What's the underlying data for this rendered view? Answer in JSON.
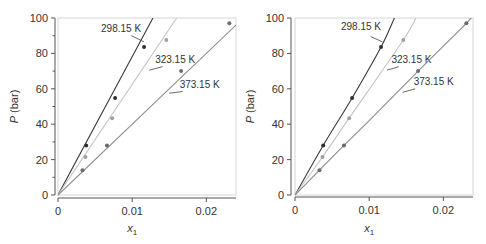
{
  "chart_data": [
    {
      "type": "scatter",
      "panel": "left",
      "fit": "linear",
      "xlabel": "x",
      "xlabel_sub": "1",
      "ylabel_italic": "P",
      "ylabel_rest": " (bar)",
      "xlim": [
        0,
        0.024
      ],
      "ylim": [
        0,
        100
      ],
      "xticks": [
        0,
        0.01,
        0.02
      ],
      "xtick_labels": [
        "0",
        "0.01",
        "0.02"
      ],
      "yticks": [
        0,
        20,
        40,
        60,
        80,
        100
      ],
      "ytick_labels": [
        "0",
        "20",
        "40",
        "60",
        "80",
        "100"
      ],
      "yminor": [
        10,
        30,
        50,
        70,
        90
      ],
      "grid": false,
      "series": [
        {
          "name": "298.15 K",
          "label": "298.15 K",
          "line_color": "#3a3a3a",
          "point_color": "#2e2e2e",
          "points": [
            [
              0.0038,
              28
            ],
            [
              0.0077,
              54.8
            ],
            [
              0.0116,
              83.6
            ]
          ],
          "curve": [
            [
              0,
              0
            ],
            [
              0.0128,
              100
            ]
          ],
          "label_at": [
            0.0058,
            92
          ],
          "leader": [
            [
              0.0099,
              90
            ],
            [
              0.0116,
              86.5
            ]
          ]
        },
        {
          "name": "323.15 K",
          "label": "323.15 K",
          "line_color": "#c4c4c4",
          "point_color": "#a0a0a0",
          "points": [
            [
              0.0037,
              21.5
            ],
            [
              0.0073,
              43.4
            ],
            [
              0.0146,
              87.6
            ]
          ],
          "curve": [
            [
              0,
              0
            ],
            [
              0.016,
              100
            ]
          ],
          "label_at": [
            0.0131,
            74.5
          ],
          "leader": [
            [
              0.0141,
              72.5
            ],
            [
              0.0123,
              70.5
            ]
          ]
        },
        {
          "name": "373.15 K",
          "label": "373.15 K",
          "line_color": "#8c8c8c",
          "point_color": "#6a6a6a",
          "points": [
            [
              0.0033,
              14
            ],
            [
              0.0066,
              28
            ],
            [
              0.0166,
              70
            ],
            [
              0.0231,
              97
            ]
          ],
          "curve": [
            [
              0,
              0
            ],
            [
              0.024,
              96
            ]
          ],
          "label_at": [
            0.0164,
            60.5
          ],
          "leader": [
            [
              0.0168,
              58.5
            ],
            [
              0.015,
              57.5
            ]
          ]
        }
      ]
    },
    {
      "type": "scatter",
      "panel": "right",
      "fit": "curve",
      "xlabel": "x",
      "xlabel_sub": "1",
      "ylabel_italic": "P",
      "ylabel_rest": " (bar)",
      "xlim": [
        0,
        0.024
      ],
      "ylim": [
        0,
        100
      ],
      "xticks": [
        0,
        0.01,
        0.02
      ],
      "xtick_labels": [
        "0",
        "0.01",
        "0.02"
      ],
      "yticks": [
        0,
        20,
        40,
        60,
        80,
        100
      ],
      "ytick_labels": [
        "0",
        "20",
        "40",
        "60",
        "80",
        "100"
      ],
      "yminor": [],
      "grid": false,
      "series": [
        {
          "name": "298.15 K",
          "label": "298.15 K",
          "line_color": "#3a3a3a",
          "point_color": "#2e2e2e",
          "points": [
            [
              0.0038,
              28
            ],
            [
              0.0077,
              54.8
            ],
            [
              0.0116,
              83.6
            ]
          ],
          "curve": [
            [
              0,
              0
            ],
            [
              0.0038,
              28
            ],
            [
              0.0077,
              54.8
            ],
            [
              0.0116,
              83.6
            ],
            [
              0.0134,
              100
            ]
          ],
          "label_at": [
            0.0062,
            93
          ],
          "leader": [
            [
              0.0102,
              89.5
            ],
            [
              0.0118,
              86.5
            ]
          ]
        },
        {
          "name": "323.15 K",
          "label": "323.15 K",
          "line_color": "#c4c4c4",
          "point_color": "#a0a0a0",
          "points": [
            [
              0.0037,
              21.5
            ],
            [
              0.0073,
              43.4
            ],
            [
              0.0146,
              87.6
            ]
          ],
          "curve": [
            [
              0,
              0
            ],
            [
              0.0037,
              21.5
            ],
            [
              0.0073,
              43.4
            ],
            [
              0.0146,
              87.6
            ],
            [
              0.0163,
              100
            ]
          ],
          "label_at": [
            0.013,
            74.5
          ],
          "leader": [
            [
              0.014,
              72.5
            ],
            [
              0.0124,
              70.5
            ]
          ]
        },
        {
          "name": "373.15 K",
          "label": "373.15 K",
          "line_color": "#8c8c8c",
          "point_color": "#6a6a6a",
          "points": [
            [
              0.0033,
              14
            ],
            [
              0.0066,
              28
            ],
            [
              0.0166,
              70
            ],
            [
              0.0231,
              97
            ]
          ],
          "curve": [
            [
              0,
              0
            ],
            [
              0.0033,
              14
            ],
            [
              0.0066,
              28
            ],
            [
              0.01,
              42
            ],
            [
              0.0166,
              70
            ],
            [
              0.0231,
              97
            ],
            [
              0.0236,
              100
            ]
          ],
          "label_at": [
            0.016,
            62
          ],
          "leader": [
            [
              0.0162,
              60
            ],
            [
              0.0145,
              58
            ]
          ]
        }
      ]
    }
  ]
}
